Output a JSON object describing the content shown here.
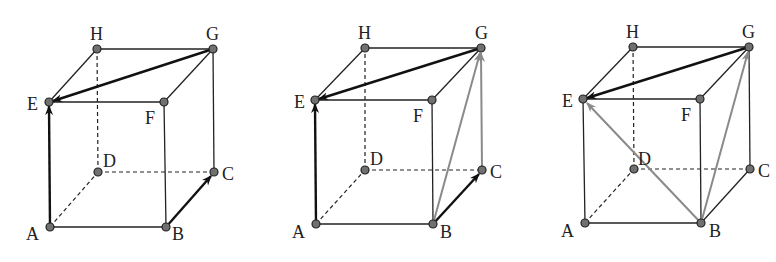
{
  "figure": {
    "colors": {
      "edge": "#222222",
      "vector_black": "#111111",
      "vector_gray": "#8a8a8a",
      "vertex_fill": "#707070",
      "vertex_stroke": "#222222"
    },
    "cubes": [
      {
        "id": "cube-1",
        "labels": {
          "A": "A",
          "B": "B",
          "C": "C",
          "D": "D",
          "E": "E",
          "F": "F",
          "G": "G",
          "H": "H"
        },
        "vectors": [
          {
            "from": "A",
            "to": "E",
            "color": "black"
          },
          {
            "from": "B",
            "to": "C",
            "color": "black"
          },
          {
            "from": "G",
            "to": "E",
            "color": "black"
          }
        ]
      },
      {
        "id": "cube-2",
        "labels": {
          "A": "A",
          "B": "B",
          "C": "C",
          "D": "D",
          "E": "E",
          "F": "F",
          "G": "G",
          "H": "H"
        },
        "vectors": [
          {
            "from": "A",
            "to": "E",
            "color": "black"
          },
          {
            "from": "B",
            "to": "C",
            "color": "black"
          },
          {
            "from": "G",
            "to": "E",
            "color": "black"
          },
          {
            "from": "C",
            "to": "G",
            "color": "gray"
          },
          {
            "from": "B",
            "to": "G",
            "color": "gray"
          }
        ]
      },
      {
        "id": "cube-3",
        "labels": {
          "A": "A",
          "B": "B",
          "C": "C",
          "D": "D",
          "E": "E",
          "F": "F",
          "G": "G",
          "H": "H"
        },
        "vectors": [
          {
            "from": "G",
            "to": "E",
            "color": "black"
          },
          {
            "from": "B",
            "to": "G",
            "color": "gray"
          },
          {
            "from": "B",
            "to": "E",
            "color": "gray"
          }
        ]
      }
    ]
  }
}
